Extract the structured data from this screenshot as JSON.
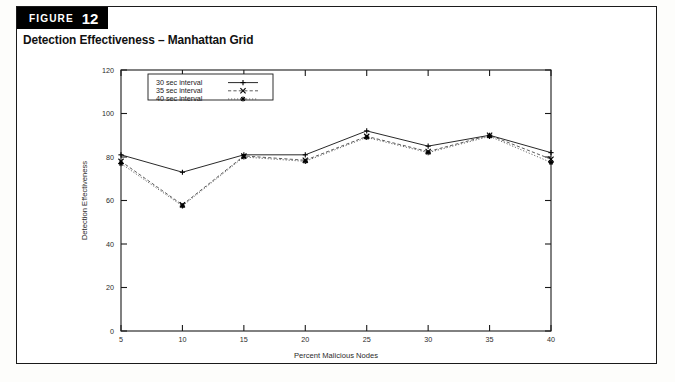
{
  "figure": {
    "badge_word": "FIGURE",
    "badge_number": "12",
    "caption": "Detection Effectiveness – Manhattan Grid"
  },
  "colors": {
    "badge_bg": "#000000",
    "badge_fg": "#ffffff",
    "frame": "#1a1a1a",
    "series_30": "#111111",
    "series_35": "#333333",
    "series_40": "#444444",
    "plot_bg": "#ffffff"
  },
  "chart_data": {
    "type": "line",
    "title": "Detection Effectiveness – Manhattan Grid",
    "xlabel": "Percent Malicious Nodes",
    "ylabel": "Detection Effectiveness",
    "x": [
      5,
      10,
      15,
      20,
      25,
      30,
      35,
      40
    ],
    "xlim": [
      5,
      40
    ],
    "ylim": [
      0,
      120
    ],
    "xticks": [
      5,
      10,
      15,
      20,
      25,
      30,
      35,
      40
    ],
    "yticks": [
      0,
      20,
      40,
      60,
      80,
      100,
      120
    ],
    "grid": false,
    "legend_position": "upper left inside",
    "series": [
      {
        "name": "30 sec interval",
        "marker": "+",
        "linestyle": "solid",
        "values": [
          81,
          73,
          81,
          81,
          92,
          85,
          90,
          82
        ]
      },
      {
        "name": "35 sec interval",
        "marker": "×",
        "linestyle": "dashed",
        "values": [
          78,
          58,
          80.5,
          78.5,
          89.5,
          82.5,
          90,
          79
        ]
      },
      {
        "name": "40 sec interval",
        "marker": "*",
        "linestyle": "dotted",
        "values": [
          77,
          57.5,
          80,
          78,
          89,
          82,
          89.5,
          77.5
        ]
      }
    ]
  }
}
